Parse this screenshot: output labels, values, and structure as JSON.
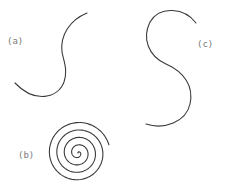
{
  "figure": {
    "width": 225,
    "height": 187,
    "stroke_color": "#3a3a3a",
    "label_color": "#7a7a7a",
    "panels": [
      {
        "id": "a",
        "label": "(a)",
        "label_pos": [
          7,
          44
        ],
        "shape": "S-curve",
        "path": "M 87 13 C 70 20, 60 35, 62 52 C 64 62, 68 70, 64 82 C 58 98, 35 104, 15 83"
      },
      {
        "id": "b",
        "label": "(b)",
        "label_pos": [
          18,
          158
        ],
        "shape": "spiral",
        "spiral": {
          "cx": 78,
          "cy": 153,
          "turns": 4.3,
          "max_radius": 32,
          "start_angle_deg": -15
        }
      },
      {
        "id": "c",
        "label": "(c)",
        "label_pos": [
          197,
          47
        ],
        "shape": "reverse-S-curve",
        "path": "M 196 23 C 185 8, 160 5, 150 22 C 142 38, 148 56, 166 64 C 184 72, 194 86, 190 104 C 186 122, 164 130, 146 124"
      }
    ]
  }
}
